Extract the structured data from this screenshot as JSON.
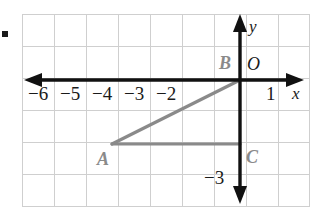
{
  "figure": {
    "bullet_marker": "■",
    "grid": {
      "cell_size_px": 32,
      "x_axis_label": "x",
      "y_axis_label": "y",
      "origin_label": "O"
    },
    "x_tick_labels": [
      {
        "text": "−6",
        "value": -6
      },
      {
        "text": "−5",
        "value": -5
      },
      {
        "text": "−4",
        "value": -4
      },
      {
        "text": "−3",
        "value": -3
      },
      {
        "text": "−2",
        "value": -2
      },
      {
        "text": "1",
        "value": 1
      }
    ],
    "y_tick_labels": [
      {
        "text": "−3",
        "value": -3
      }
    ],
    "vertices": [
      {
        "label": "A",
        "x": -4,
        "y": -2
      },
      {
        "label": "B",
        "x": 0,
        "y": 0
      },
      {
        "label": "C",
        "x": 0,
        "y": -2
      }
    ],
    "colors": {
      "grid_line": "#cfcfcf",
      "axis": "#111111",
      "shape_stroke": "#8a8a8a",
      "label_text": "#1a1a1a",
      "vertex_label_text": "#8a8a8a",
      "background": "#ffffff"
    }
  }
}
